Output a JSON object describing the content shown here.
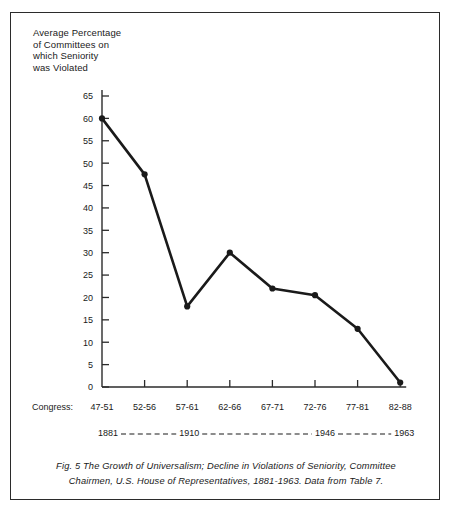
{
  "figure": {
    "axis_title": "Average Percentage\nof Committees on\nwhich Seniority\nwas Violated",
    "congress_row_label": "Congress:",
    "caption": "Fig. 5 The Growth of Universalism; Decline in Violations of Seniority, Committee Chairmen, U.S. House of Representatives, 1881-1963. Data from Table 7.",
    "line_color": "#1a1a1a",
    "axis_color": "#2b2b2b",
    "background": "#ffffff"
  },
  "chart_data": {
    "type": "line",
    "title": "Fig. 5 The Growth of Universalism; Decline in Violations of Seniority, Committee Chairmen, U.S. House of Representatives, 1881-1963. Data from Table 7.",
    "xlabel": "Congress:",
    "ylabel": "Average Percentage of Committees on which Seniority was Violated",
    "categories": [
      "47-51",
      "52-56",
      "57-61",
      "62-66",
      "67-71",
      "72-76",
      "77-81",
      "82-88"
    ],
    "values": [
      60,
      47.5,
      18,
      30,
      22,
      20.5,
      13,
      1
    ],
    "ylim": [
      0,
      65
    ],
    "yticks": [
      0,
      5,
      10,
      15,
      20,
      25,
      30,
      35,
      40,
      45,
      50,
      55,
      60,
      65
    ],
    "ytick_labels": [
      "0",
      "5",
      "10",
      "15",
      "20",
      "25",
      "30",
      "35",
      "40",
      "45",
      "50",
      "55",
      "60",
      "65"
    ],
    "grid": false,
    "legend": "none",
    "markers": "filled-circle",
    "year_scale": {
      "labels": [
        "1881",
        "1910",
        "1946",
        "1963"
      ],
      "connector": "dashed"
    }
  }
}
